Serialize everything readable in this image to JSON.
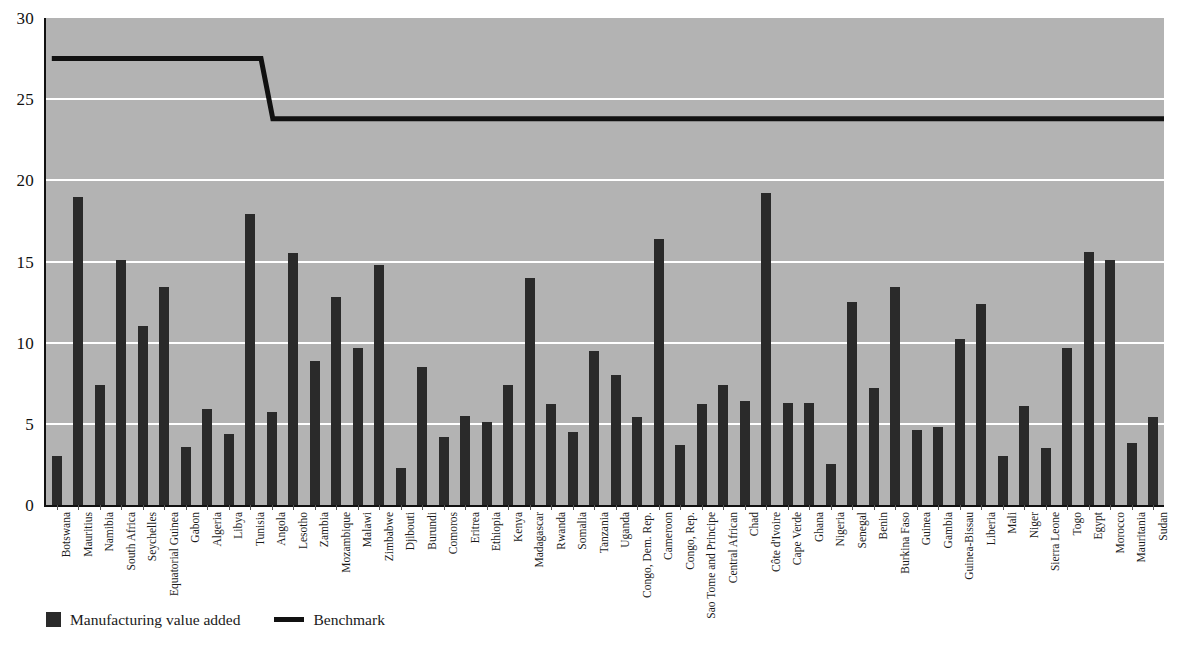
{
  "chart_data": {
    "type": "bar",
    "title": "",
    "subtitle": "",
    "xlabel": "",
    "ylabel": "",
    "ylim": [
      0,
      30
    ],
    "yticks": [
      0,
      5,
      10,
      15,
      20,
      25,
      30
    ],
    "grid": true,
    "grid_color": "#ffffff",
    "plot_background": "#b3b3b3",
    "bar_color": "#2a2a2a",
    "line_color": "#111111",
    "legend_position": "bottom-left",
    "categories": [
      "Botswana",
      "Mauritius",
      "Namibia",
      "South Africa",
      "Seychelles",
      "Equatorial Guinea",
      "Gabon",
      "Algeria",
      "Libya",
      "Tunisia",
      "Angola",
      "Lesotho",
      "Zambia",
      "Mozambique",
      "Malawi",
      "Zimbabwe",
      "Djibouti",
      "Burundi",
      "Comoros",
      "Eritrea",
      "Ethiopia",
      "Kenya",
      "Madagascar",
      "Rwanda",
      "Somalia",
      "Tanzania",
      "Uganda",
      "Congo, Dem. Rep.",
      "Cameroon",
      "Congo, Rep.",
      "Sao Tome and Principe",
      "Central African",
      "Chad",
      "Côte d'Ivoire",
      "Cape Verde",
      "Ghana",
      "Nigeria",
      "Senegal",
      "Benin",
      "Burkina Faso",
      "Guinea",
      "Gambia",
      "Guinea-Bissau",
      "Liberia",
      "Mali",
      "Niger",
      "Sierra Leone",
      "Togo",
      "Egypt",
      "Morocco",
      "Mauritania",
      "Sudan"
    ],
    "series": [
      {
        "name": "Manufacturing value added",
        "type": "bar",
        "values": [
          3.0,
          19.0,
          7.4,
          15.1,
          11.0,
          13.4,
          3.6,
          5.9,
          4.4,
          17.9,
          5.7,
          15.5,
          8.9,
          12.8,
          9.7,
          14.8,
          2.3,
          8.5,
          4.2,
          5.5,
          5.1,
          7.4,
          14.0,
          6.2,
          4.5,
          9.5,
          8.0,
          5.4,
          16.4,
          3.7,
          6.2,
          7.4,
          6.4,
          19.2,
          6.3,
          6.3,
          2.5,
          12.5,
          7.2,
          13.4,
          4.6,
          4.8,
          10.2,
          12.4,
          3.0,
          6.1,
          3.5,
          9.7,
          15.6,
          15.1,
          3.8,
          5.4
        ]
      },
      {
        "name": "Benchmark",
        "type": "line",
        "step": true,
        "values": [
          27.5,
          27.5,
          27.5,
          27.5,
          27.5,
          27.5,
          27.5,
          27.5,
          27.5,
          27.5,
          23.8,
          23.8,
          23.8,
          23.8,
          23.8,
          23.8,
          23.8,
          23.8,
          23.8,
          23.8,
          23.8,
          23.8,
          23.8,
          23.8,
          23.8,
          23.8,
          23.8,
          23.8,
          23.8,
          23.8,
          23.8,
          23.8,
          23.8,
          23.8,
          23.8,
          23.8,
          23.8,
          23.8,
          23.8,
          23.8,
          23.8,
          23.8,
          23.8,
          23.8,
          23.8,
          23.8,
          23.8,
          23.8,
          23.8,
          23.8,
          23.8,
          23.8
        ]
      }
    ]
  },
  "legend": {
    "entries": [
      {
        "label": "Manufacturing value added",
        "marker": "square",
        "color": "#2a2a2a"
      },
      {
        "label": "Benchmark",
        "marker": "line",
        "color": "#111111"
      }
    ]
  }
}
